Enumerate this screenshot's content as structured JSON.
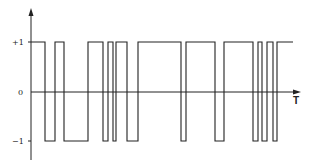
{
  "diagram": {
    "type": "binary random telegraph signal",
    "y_labels": [
      {
        "text": "+1",
        "value": 1
      },
      {
        "text": "0",
        "value": 0
      },
      {
        "text": "−1",
        "value": -1
      }
    ],
    "x_axis_label": "T",
    "colors": {
      "line": "#222222",
      "background": "#ffffff"
    },
    "waveform": {
      "start_level": 1,
      "transitions_px": [
        45,
        55,
        64,
        88,
        103,
        108,
        113,
        116,
        127,
        138,
        181,
        186,
        215,
        224,
        253,
        258,
        262,
        267,
        273,
        277
      ],
      "start_px": 31,
      "end_px": 293
    }
  }
}
